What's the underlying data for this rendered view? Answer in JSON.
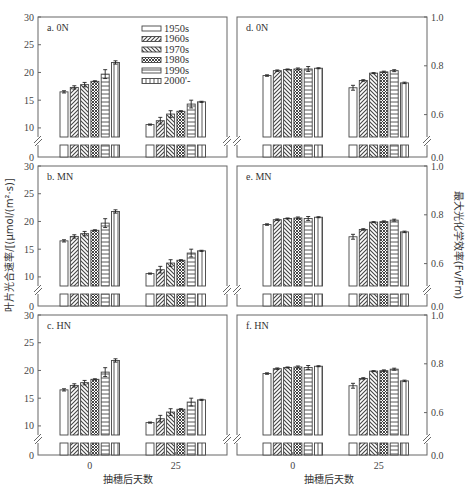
{
  "figure": {
    "left_ylabel": "叶片光合速率/[(μmol/(m²·s)]",
    "right_ylabel": "最大光化学效率(Fv/Fm)",
    "xlabel": "抽穗后天数",
    "x_ticks": [
      "0",
      "25"
    ]
  },
  "legend": {
    "items": [
      {
        "label": "1950s",
        "pattern": "blank"
      },
      {
        "label": "1960s",
        "pattern": "diag-right"
      },
      {
        "label": "1970s",
        "pattern": "diag-left"
      },
      {
        "label": "1980s",
        "pattern": "cross"
      },
      {
        "label": "1990s",
        "pattern": "horizontal"
      },
      {
        "label": "2000'-",
        "pattern": "vertical"
      }
    ]
  },
  "colors": {
    "axis": "#666666",
    "bar_stroke": "#444444",
    "text": "#333333"
  },
  "chart_data": [
    {
      "panel": "a",
      "title": "a. 0N",
      "type": "bar",
      "categories": [
        "0",
        "25"
      ],
      "ylabel": "叶片光合速率/[(μmol/(m²·s)]",
      "yticks": [
        "0",
        "10",
        "15",
        "20",
        "25",
        "30"
      ],
      "ylim": [
        0,
        30
      ],
      "axis_break": [
        0,
        8
      ],
      "series": [
        {
          "name": "1950s",
          "values": [
            16.5,
            10.6
          ],
          "err": [
            0.2,
            0.1
          ]
        },
        {
          "name": "1960s",
          "values": [
            17.3,
            11.3
          ],
          "err": [
            0.3,
            0.6
          ]
        },
        {
          "name": "1970s",
          "values": [
            17.8,
            12.5
          ],
          "err": [
            0.4,
            0.6
          ]
        },
        {
          "name": "1980s",
          "values": [
            18.4,
            13.0
          ],
          "err": [
            0.1,
            0.1
          ]
        },
        {
          "name": "1990s",
          "values": [
            19.7,
            14.3
          ],
          "err": [
            0.8,
            0.7
          ]
        },
        {
          "name": "2000'-",
          "values": [
            21.8,
            14.7
          ],
          "err": [
            0.3,
            0.1
          ]
        }
      ]
    },
    {
      "panel": "b",
      "title": "b. MN",
      "type": "bar",
      "categories": [
        "0",
        "25"
      ],
      "ylabel": "叶片光合速率/[(μmol/(m²·s)]",
      "yticks": [
        "0",
        "10",
        "15",
        "20",
        "25",
        "30"
      ],
      "ylim": [
        0,
        30
      ],
      "axis_break": [
        0,
        8
      ],
      "series": [
        {
          "name": "1950s",
          "values": [
            16.5,
            10.6
          ],
          "err": [
            0.2,
            0.1
          ]
        },
        {
          "name": "1960s",
          "values": [
            17.3,
            11.3
          ],
          "err": [
            0.3,
            0.6
          ]
        },
        {
          "name": "1970s",
          "values": [
            17.8,
            12.5
          ],
          "err": [
            0.4,
            0.6
          ]
        },
        {
          "name": "1980s",
          "values": [
            18.4,
            13.0
          ],
          "err": [
            0.1,
            0.1
          ]
        },
        {
          "name": "1990s",
          "values": [
            19.7,
            14.3
          ],
          "err": [
            0.8,
            0.7
          ]
        },
        {
          "name": "2000'-",
          "values": [
            21.8,
            14.7
          ],
          "err": [
            0.3,
            0.1
          ]
        }
      ]
    },
    {
      "panel": "c",
      "title": "c. HN",
      "type": "bar",
      "categories": [
        "0",
        "25"
      ],
      "ylabel": "叶片光合速率/[(μmol/(m²·s)]",
      "yticks": [
        "0",
        "10",
        "15",
        "20",
        "25",
        "30"
      ],
      "ylim": [
        0,
        30
      ],
      "axis_break": [
        0,
        8
      ],
      "series": [
        {
          "name": "1950s",
          "values": [
            16.5,
            10.6
          ],
          "err": [
            0.2,
            0.1
          ]
        },
        {
          "name": "1960s",
          "values": [
            17.3,
            11.3
          ],
          "err": [
            0.3,
            0.6
          ]
        },
        {
          "name": "1970s",
          "values": [
            17.8,
            12.5
          ],
          "err": [
            0.4,
            0.6
          ]
        },
        {
          "name": "1980s",
          "values": [
            18.4,
            13.0
          ],
          "err": [
            0.1,
            0.1
          ]
        },
        {
          "name": "1990s",
          "values": [
            19.7,
            14.3
          ],
          "err": [
            0.8,
            0.7
          ]
        },
        {
          "name": "2000'-",
          "values": [
            21.8,
            14.7
          ],
          "err": [
            0.3,
            0.1
          ]
        }
      ]
    },
    {
      "panel": "d",
      "title": "d. 0N",
      "type": "bar",
      "categories": [
        "0",
        "25"
      ],
      "ylabel": "最大光化学效率(Fv/Fm)",
      "yticks": [
        "0.0",
        "0.6",
        "0.8",
        "1.0"
      ],
      "ylim": [
        0,
        1.0
      ],
      "axis_break": [
        0,
        0.5
      ],
      "series": [
        {
          "name": "1950s",
          "values": [
            0.76,
            0.71
          ],
          "err": [
            0.003,
            0.01
          ]
        },
        {
          "name": "1960s",
          "values": [
            0.78,
            0.74
          ],
          "err": [
            0.003,
            0.003
          ]
        },
        {
          "name": "1970s",
          "values": [
            0.785,
            0.77
          ],
          "err": [
            0.002,
            0.002
          ]
        },
        {
          "name": "1980s",
          "values": [
            0.787,
            0.775
          ],
          "err": [
            0.004,
            0.003
          ]
        },
        {
          "name": "1990s",
          "values": [
            0.787,
            0.78
          ],
          "err": [
            0.01,
            0.004
          ]
        },
        {
          "name": "2000'-",
          "values": [
            0.79,
            0.73
          ],
          "err": [
            0.002,
            0.003
          ]
        }
      ]
    },
    {
      "panel": "e",
      "title": "e. MN",
      "type": "bar",
      "categories": [
        "0",
        "25"
      ],
      "ylabel": "最大光化学效率(Fv/Fm)",
      "yticks": [
        "0.0",
        "0.6",
        "0.8",
        "1.0"
      ],
      "ylim": [
        0,
        1.0
      ],
      "axis_break": [
        0,
        0.5
      ],
      "series": [
        {
          "name": "1950s",
          "values": [
            0.76,
            0.71
          ],
          "err": [
            0.003,
            0.01
          ]
        },
        {
          "name": "1960s",
          "values": [
            0.78,
            0.74
          ],
          "err": [
            0.003,
            0.003
          ]
        },
        {
          "name": "1970s",
          "values": [
            0.785,
            0.77
          ],
          "err": [
            0.002,
            0.002
          ]
        },
        {
          "name": "1980s",
          "values": [
            0.787,
            0.772
          ],
          "err": [
            0.004,
            0.003
          ]
        },
        {
          "name": "1990s",
          "values": [
            0.785,
            0.778
          ],
          "err": [
            0.008,
            0.004
          ]
        },
        {
          "name": "2000'-",
          "values": [
            0.79,
            0.73
          ],
          "err": [
            0.002,
            0.003
          ]
        }
      ]
    },
    {
      "panel": "f",
      "title": "f. HN",
      "type": "bar",
      "categories": [
        "0",
        "25"
      ],
      "ylabel": "最大光化学效率(Fv/Fm)",
      "yticks": [
        "0.0",
        "0.6",
        "0.8",
        "1.0"
      ],
      "ylim": [
        0,
        1.0
      ],
      "axis_break": [
        0,
        0.5
      ],
      "series": [
        {
          "name": "1950s",
          "values": [
            0.76,
            0.71
          ],
          "err": [
            0.003,
            0.01
          ]
        },
        {
          "name": "1960s",
          "values": [
            0.78,
            0.74
          ],
          "err": [
            0.003,
            0.003
          ]
        },
        {
          "name": "1970s",
          "values": [
            0.785,
            0.77
          ],
          "err": [
            0.002,
            0.002
          ]
        },
        {
          "name": "1980s",
          "values": [
            0.787,
            0.772
          ],
          "err": [
            0.004,
            0.003
          ]
        },
        {
          "name": "1990s",
          "values": [
            0.785,
            0.778
          ],
          "err": [
            0.008,
            0.004
          ]
        },
        {
          "name": "2000'-",
          "values": [
            0.79,
            0.73
          ],
          "err": [
            0.002,
            0.003
          ]
        }
      ]
    }
  ]
}
